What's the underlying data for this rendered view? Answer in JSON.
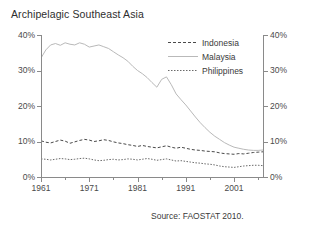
{
  "chart_data": {
    "type": "line",
    "title": "Archipelagic Southeast Asia",
    "xlabel": "",
    "ylabel": "",
    "ylim": [
      0,
      40
    ],
    "xlim": [
      1961,
      2007
    ],
    "ytick_labels": [
      "0%",
      "10%",
      "20%",
      "30%",
      "40%"
    ],
    "ytick_values": [
      0,
      10,
      20,
      30,
      40
    ],
    "xtick_labels": [
      "1961",
      "1971",
      "1981",
      "1991",
      "2001"
    ],
    "xtick_values": [
      1961,
      1971,
      1981,
      1991,
      2001
    ],
    "xtick_minor_values": [
      1966,
      1976,
      1986,
      1996,
      2006
    ],
    "grid": false,
    "legend_position": "upper-right-inside",
    "source": "Source: FAOSTAT 2010.",
    "y_axis_duplicated_right": true,
    "series": [
      {
        "name": "Indonesia",
        "style": "dashed",
        "color": "#4a4a4a",
        "x": [
          1961,
          1962,
          1963,
          1964,
          1965,
          1966,
          1967,
          1968,
          1969,
          1970,
          1971,
          1972,
          1973,
          1974,
          1975,
          1976,
          1977,
          1978,
          1979,
          1980,
          1981,
          1982,
          1983,
          1984,
          1985,
          1986,
          1987,
          1988,
          1989,
          1990,
          1991,
          1992,
          1993,
          1994,
          1995,
          1996,
          1997,
          1998,
          1999,
          2000,
          2001,
          2002,
          2003,
          2004,
          2005,
          2006,
          2007
        ],
        "values": [
          10.2,
          9.8,
          9.6,
          10.0,
          10.4,
          10.1,
          9.5,
          9.9,
          10.3,
          10.6,
          10.4,
          10.0,
          10.2,
          10.5,
          10.3,
          9.9,
          9.6,
          9.4,
          9.1,
          8.9,
          8.6,
          8.9,
          8.6,
          8.4,
          8.2,
          8.5,
          8.8,
          8.4,
          8.1,
          8.4,
          8.1,
          7.8,
          7.6,
          7.5,
          7.3,
          7.2,
          7.1,
          6.8,
          6.6,
          6.5,
          6.4,
          6.6,
          6.5,
          6.7,
          6.9,
          7.0,
          7.1
        ]
      },
      {
        "name": "Malaysia",
        "style": "solid-light",
        "color": "#b9b9b9",
        "x": [
          1961,
          1962,
          1963,
          1964,
          1965,
          1966,
          1967,
          1968,
          1969,
          1970,
          1971,
          1972,
          1973,
          1974,
          1975,
          1976,
          1977,
          1978,
          1979,
          1980,
          1981,
          1982,
          1983,
          1984,
          1985,
          1986,
          1987,
          1988,
          1989,
          1990,
          1991,
          1992,
          1993,
          1994,
          1995,
          1996,
          1997,
          1998,
          1999,
          2000,
          2001,
          2002,
          2003,
          2004,
          2005,
          2006,
          2007
        ],
        "values": [
          33.5,
          35.8,
          37.2,
          37.6,
          37.1,
          37.8,
          37.4,
          37.2,
          37.8,
          37.4,
          36.6,
          36.9,
          37.2,
          36.7,
          36.2,
          35.3,
          34.4,
          33.6,
          32.6,
          31.2,
          30.0,
          29.1,
          28.0,
          26.6,
          25.3,
          27.5,
          28.2,
          26.0,
          23.4,
          21.8,
          20.3,
          18.6,
          16.9,
          15.3,
          13.9,
          12.6,
          11.5,
          10.6,
          9.7,
          9.0,
          8.4,
          8.1,
          7.8,
          7.6,
          7.5,
          7.5,
          7.6
        ]
      },
      {
        "name": "Philippines",
        "style": "dotted",
        "color": "#6a6a6a",
        "x": [
          1961,
          1962,
          1963,
          1964,
          1965,
          1966,
          1967,
          1968,
          1969,
          1970,
          1971,
          1972,
          1973,
          1974,
          1975,
          1976,
          1977,
          1978,
          1979,
          1980,
          1981,
          1982,
          1983,
          1984,
          1985,
          1986,
          1987,
          1988,
          1989,
          1990,
          1991,
          1992,
          1993,
          1994,
          1995,
          1996,
          1997,
          1998,
          1999,
          2000,
          2001,
          2002,
          2003,
          2004,
          2005,
          2006,
          2007
        ],
        "values": [
          5.1,
          5.0,
          4.8,
          5.0,
          5.2,
          5.1,
          4.9,
          5.0,
          5.2,
          5.3,
          5.1,
          4.8,
          4.6,
          4.7,
          4.9,
          5.0,
          4.8,
          4.9,
          5.1,
          5.0,
          4.8,
          5.0,
          5.2,
          5.0,
          4.7,
          4.9,
          5.1,
          4.8,
          4.5,
          4.6,
          4.4,
          4.2,
          4.0,
          3.9,
          3.7,
          3.6,
          3.4,
          3.1,
          2.9,
          2.8,
          2.7,
          2.9,
          3.1,
          3.2,
          3.3,
          3.3,
          3.2
        ]
      }
    ]
  },
  "legend": [
    {
      "label": "Indonesia"
    },
    {
      "label": "Malaysia"
    },
    {
      "label": "Philippines"
    }
  ],
  "colors": {
    "indonesia": "#4a4a4a",
    "malaysia": "#b9b9b9",
    "philippines": "#6a6a6a",
    "axis": "#8a8a8a",
    "background": "#ffffff"
  }
}
